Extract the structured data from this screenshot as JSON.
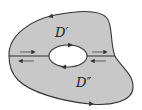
{
  "diagram": {
    "type": "region-with-hole-cut",
    "colors": {
      "region_fill": "#c8c8c8",
      "hole_fill": "#ffffff",
      "stroke": "#333333",
      "background": "#ffffff"
    },
    "labels": {
      "upper_region": "D′",
      "lower_region": "D″"
    },
    "arrows": {
      "outer_boundary": "counterclockwise",
      "inner_hole": "clockwise",
      "cut_upper": "rightward",
      "cut_lower": "leftward"
    }
  }
}
